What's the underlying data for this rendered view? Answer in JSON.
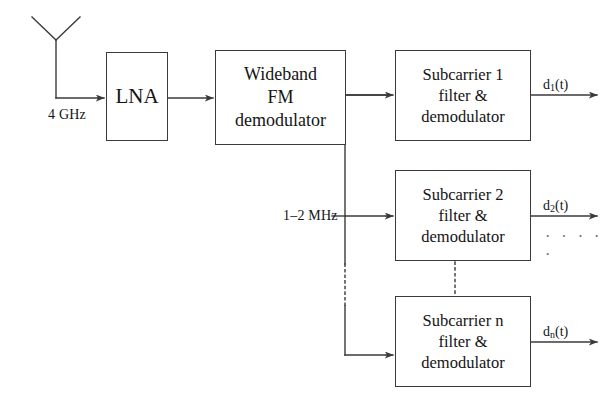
{
  "diagram": {
    "stroke_color": "#3a3a3a",
    "text_color": "#141414",
    "background_color": "#ffffff",
    "dot_color": "#6d6d6d"
  },
  "source": {
    "antenna": {
      "name": "receive antenna",
      "icon": "antenna-icon"
    },
    "input_label": "4 GHz"
  },
  "blocks": {
    "lna": {
      "lines": [
        "LNA"
      ],
      "line1": "LNA"
    },
    "wideband_fm_demodulator": {
      "lines": [
        "Wideband",
        "FM",
        "demodulator"
      ],
      "line1": "Wideband",
      "line2": "FM",
      "line3": "demodulator"
    },
    "subcarrier_1": {
      "lines": [
        "Subcarrier 1",
        "filter &",
        "demodulator"
      ],
      "line1": "Subcarrier 1",
      "line2": "filter &",
      "line3": "demodulator"
    },
    "subcarrier_2": {
      "lines": [
        "Subcarrier 2",
        "filter &",
        "demodulator"
      ],
      "line1": "Subcarrier 2",
      "line2": "filter &",
      "line3": "demodulator"
    },
    "subcarrier_n": {
      "lines": [
        "Subcarrier n",
        "filter &",
        "demodulator"
      ],
      "line1": "Subcarrier n",
      "line2": "filter &",
      "line3": "demodulator"
    }
  },
  "bus": {
    "label": "1–2  MHz"
  },
  "outputs": {
    "d1": {
      "base": "d",
      "sub": "1",
      "suffix": "(t)"
    },
    "d2": {
      "base": "d",
      "sub": "2",
      "suffix": "(t)"
    },
    "dn": {
      "base": "d",
      "sub": "n",
      "suffix": "(t)"
    },
    "ellipsis": "· · · · ·"
  }
}
